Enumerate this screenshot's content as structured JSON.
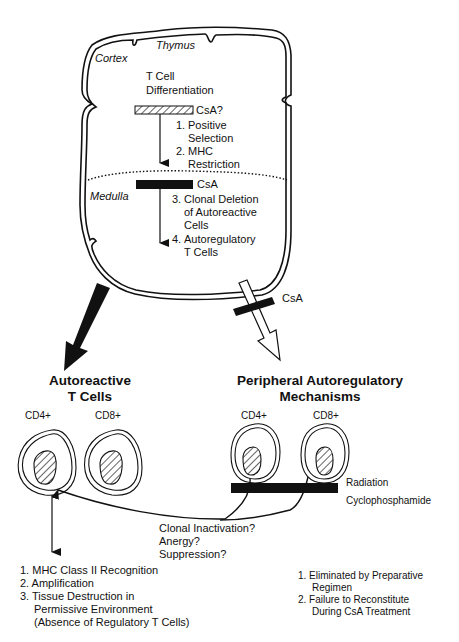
{
  "thymus": {
    "title": "Thymus",
    "cortex_label": "Cortex",
    "medulla_label": "Medulla",
    "differentiation": [
      "T Cell",
      "Differentiation"
    ],
    "csa_question": "CsA?",
    "csa_medulla": "CsA",
    "steps": [
      {
        "num": "1.",
        "lines": [
          "Positive",
          "Selection"
        ]
      },
      {
        "num": "2.",
        "lines": [
          "MHC",
          "Restriction"
        ]
      },
      {
        "num": "3.",
        "lines": [
          "Clonal Deletion",
          "of Autoreactive",
          "Cells"
        ]
      },
      {
        "num": "4.",
        "lines": [
          "Autoregulatory",
          "T Cells"
        ]
      }
    ]
  },
  "pathway_block": {
    "csa_label": "CsA"
  },
  "autoreactive": {
    "title": [
      "Autoreactive",
      "T Cells"
    ],
    "cells": [
      "CD4+",
      "CD8+"
    ],
    "outcomes": [
      "1. MHC Class II Recognition",
      "2. Amplification",
      "3. Tissue Destruction in",
      "Permissive Environment",
      "(Absence of Regulatory T Cells)"
    ]
  },
  "peripheral": {
    "title": [
      "Peripheral Autoregulatory",
      "Mechanisms"
    ],
    "cells": [
      "CD4+",
      "CD8+"
    ],
    "blockers": [
      "Radiation",
      "Cyclophosphamide"
    ],
    "outcomes": [
      "1. Eliminated by Preparative",
      "Regimen",
      "2. Failure to Reconstitute",
      "During CsA Treatment"
    ]
  },
  "feedback": {
    "labels": [
      "Clonal Inactivation?",
      "Anergy?",
      "Suppression?"
    ]
  },
  "colors": {
    "ink": "#111111",
    "background": "#ffffff"
  }
}
